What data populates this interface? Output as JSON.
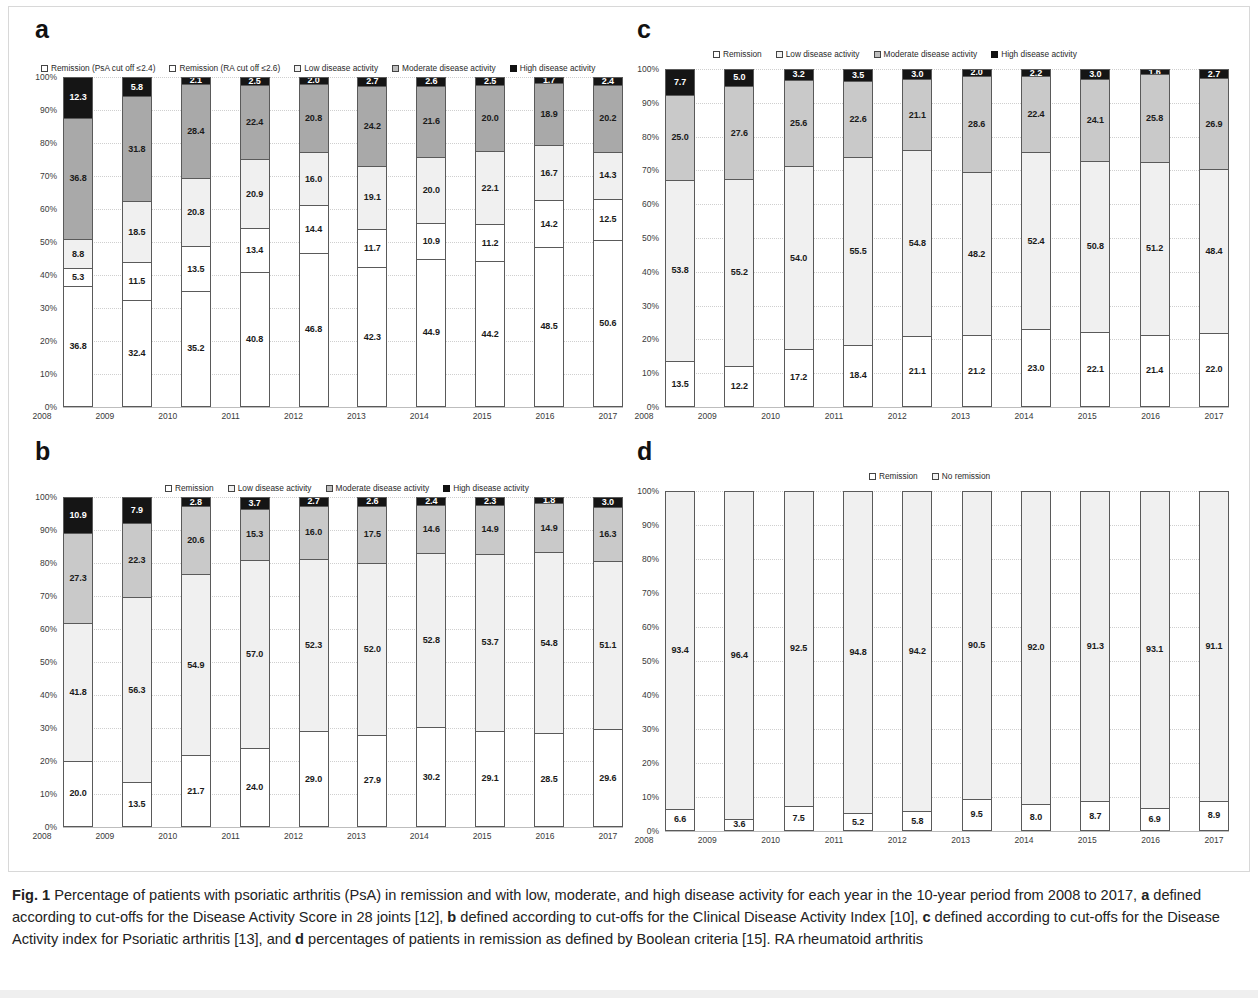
{
  "figure": {
    "caption_prefix": "Fig. 1",
    "caption_text": " Percentage of patients with psoriatic arthritis (PsA) in remission and with low, moderate, and high disease activity for each year in the 10-year period from 2008 to 2017, ",
    "caption_a_tag": "a",
    "caption_a_text": " defined according to cut-offs for the Disease Activity Score in 28 joints [12], ",
    "caption_b_tag": "b",
    "caption_b_text": " defined according to cut-offs for the Clinical Disease Activity Index [10], ",
    "caption_c_tag": "c",
    "caption_c_text": " defined according to cut-offs for the Disease Activity index for Psoriatic arthritis [13], and ",
    "caption_d_tag": "d",
    "caption_d_text": " percentages of patients in remission as defined by Boolean criteria [15]. RA rheumatoid arthritis"
  },
  "panels": {
    "a": {
      "letter": "a"
    },
    "b": {
      "letter": "b"
    },
    "c": {
      "letter": "c"
    },
    "d": {
      "letter": "d"
    }
  },
  "y_ticks": [
    "100%",
    "90%",
    "80%",
    "70%",
    "60%",
    "50%",
    "40%",
    "30%",
    "20%",
    "10%",
    "0%"
  ],
  "chart_data": [
    {
      "panel": "a",
      "type": "bar",
      "stacked": true,
      "title": "",
      "xlabel": "",
      "ylabel": "",
      "ylim": [
        0,
        100
      ],
      "grid": true,
      "legend_position": "top",
      "categories": [
        "2008",
        "2009",
        "2010",
        "2011",
        "2012",
        "2013",
        "2014",
        "2015",
        "2016",
        "2017"
      ],
      "legend": [
        {
          "label": "Remission (PsA cut off ≤2.4)",
          "swatch": "sw-white"
        },
        {
          "label": "Remission (RA cut off ≤2.6)",
          "swatch": "sw-white"
        },
        {
          "label": "Low disease activity",
          "swatch": "sw-light"
        },
        {
          "label": "Moderate disease activity",
          "swatch": "sw-mid"
        },
        {
          "label": "High disease activity",
          "swatch": "sw-black"
        }
      ],
      "series": [
        {
          "name": "Remission (PsA cut off ≤2.4)",
          "fill": "seg-white",
          "values": [
            36.8,
            32.4,
            35.2,
            40.8,
            46.8,
            42.3,
            44.9,
            44.2,
            48.5,
            50.6
          ]
        },
        {
          "name": "Remission (RA cut off ≤2.6)",
          "fill": "seg-white",
          "values": [
            5.3,
            11.5,
            13.5,
            13.4,
            14.4,
            11.7,
            10.9,
            11.2,
            14.2,
            12.5
          ]
        },
        {
          "name": "Low disease activity",
          "fill": "seg-light",
          "values": [
            8.8,
            18.5,
            20.8,
            20.9,
            16.0,
            19.1,
            20.0,
            22.1,
            16.7,
            14.3
          ]
        },
        {
          "name": "Moderate disease activity",
          "fill": "seg-dark",
          "values": [
            36.8,
            31.8,
            28.4,
            22.4,
            20.8,
            24.2,
            21.6,
            20.0,
            18.9,
            20.2
          ]
        },
        {
          "name": "High disease activity",
          "fill": "seg-black",
          "values": [
            12.3,
            5.8,
            2.1,
            2.5,
            2.0,
            2.7,
            2.6,
            2.5,
            1.7,
            2.4
          ]
        }
      ]
    },
    {
      "panel": "b",
      "type": "bar",
      "stacked": true,
      "title": "",
      "xlabel": "",
      "ylabel": "",
      "ylim": [
        0,
        100
      ],
      "grid": true,
      "legend_position": "top",
      "categories": [
        "2008",
        "2009",
        "2010",
        "2011",
        "2012",
        "2013",
        "2014",
        "2015",
        "2016",
        "2017"
      ],
      "legend": [
        {
          "label": "Remission",
          "swatch": "sw-white"
        },
        {
          "label": "Low disease activity",
          "swatch": "sw-light"
        },
        {
          "label": "Moderate disease activity",
          "swatch": "sw-mid"
        },
        {
          "label": "High disease activity",
          "swatch": "sw-black"
        }
      ],
      "series": [
        {
          "name": "Remission",
          "fill": "seg-white",
          "values": [
            20.0,
            13.5,
            21.7,
            24.0,
            29.0,
            27.9,
            30.2,
            29.1,
            28.5,
            29.6
          ]
        },
        {
          "name": "Low disease activity",
          "fill": "seg-light",
          "values": [
            41.8,
            56.3,
            54.9,
            57.0,
            52.3,
            52.0,
            52.8,
            53.7,
            54.8,
            51.1
          ]
        },
        {
          "name": "Moderate disease activity",
          "fill": "seg-mid",
          "values": [
            27.3,
            22.3,
            20.6,
            15.3,
            16.0,
            17.5,
            14.6,
            14.9,
            14.9,
            16.3
          ]
        },
        {
          "name": "High disease activity",
          "fill": "seg-black",
          "values": [
            10.9,
            7.9,
            2.8,
            3.7,
            2.7,
            2.6,
            2.4,
            2.3,
            1.8,
            3.0
          ]
        }
      ]
    },
    {
      "panel": "c",
      "type": "bar",
      "stacked": true,
      "title": "",
      "xlabel": "",
      "ylabel": "",
      "ylim": [
        0,
        100
      ],
      "grid": true,
      "legend_position": "top",
      "categories": [
        "2008",
        "2009",
        "2010",
        "2011",
        "2012",
        "2013",
        "2014",
        "2015",
        "2016",
        "2017"
      ],
      "legend": [
        {
          "label": "Remission",
          "swatch": "sw-white"
        },
        {
          "label": "Low disease activity",
          "swatch": "sw-light"
        },
        {
          "label": "Moderate disease activity",
          "swatch": "sw-mid"
        },
        {
          "label": "High disease activity",
          "swatch": "sw-black"
        }
      ],
      "series": [
        {
          "name": "Remission",
          "fill": "seg-white",
          "values": [
            13.5,
            12.2,
            17.2,
            18.4,
            21.1,
            21.2,
            23.0,
            22.1,
            21.4,
            22.0
          ]
        },
        {
          "name": "Low disease activity",
          "fill": "seg-light",
          "values": [
            53.8,
            55.2,
            54.0,
            55.5,
            54.8,
            48.2,
            52.4,
            50.8,
            51.2,
            48.4
          ]
        },
        {
          "name": "Moderate disease activity",
          "fill": "seg-mid",
          "values": [
            25.0,
            27.6,
            25.6,
            22.6,
            21.1,
            28.6,
            22.4,
            24.1,
            25.8,
            26.9
          ]
        },
        {
          "name": "High disease activity",
          "fill": "seg-black",
          "values": [
            7.7,
            5.0,
            3.2,
            3.5,
            3.0,
            2.0,
            2.2,
            3.0,
            1.6,
            2.7
          ]
        }
      ]
    },
    {
      "panel": "d",
      "type": "bar",
      "stacked": true,
      "title": "",
      "xlabel": "",
      "ylabel": "",
      "ylim": [
        0,
        100
      ],
      "grid": true,
      "legend_position": "top",
      "categories": [
        "2008",
        "2009",
        "2010",
        "2011",
        "2012",
        "2013",
        "2014",
        "2015",
        "2016",
        "2017"
      ],
      "legend": [
        {
          "label": "Remission",
          "swatch": "sw-white"
        },
        {
          "label": "No remission",
          "swatch": "sw-light"
        }
      ],
      "series": [
        {
          "name": "Remission",
          "fill": "seg-white",
          "values": [
            6.6,
            3.6,
            7.5,
            5.2,
            5.8,
            9.5,
            8.0,
            8.7,
            6.9,
            8.9
          ]
        },
        {
          "name": "No remission",
          "fill": "seg-light",
          "values": [
            93.4,
            96.4,
            92.5,
            94.8,
            94.2,
            90.5,
            92.0,
            91.3,
            93.1,
            91.1
          ]
        }
      ]
    }
  ]
}
